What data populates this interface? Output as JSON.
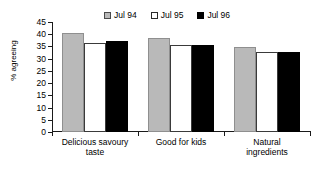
{
  "chart_data": {
    "type": "bar",
    "title": "",
    "xlabel": "",
    "ylabel": "% agreeing",
    "ylim": [
      0,
      45
    ],
    "yticks": [
      0,
      5,
      10,
      15,
      20,
      25,
      30,
      35,
      40,
      45
    ],
    "grid": false,
    "legend_position": "top-center",
    "categories": [
      "Delicious savoury taste",
      "Good for kids",
      "Natural ingredients"
    ],
    "series": [
      {
        "name": "Jul 94",
        "color": "#b9b9b9",
        "values": [
          40.5,
          38.5,
          34.8
        ]
      },
      {
        "name": "Jul 95",
        "color": "#ffffff",
        "values": [
          36.5,
          35.5,
          32.8
        ]
      },
      {
        "name": "Jul 96",
        "color": "#000000",
        "values": [
          37.4,
          35.5,
          32.7
        ]
      }
    ]
  },
  "legend": {
    "items": [
      {
        "label": "Jul 94",
        "swatch": "gray"
      },
      {
        "label": "Jul 95",
        "swatch": "white"
      },
      {
        "label": "Jul 96",
        "swatch": "black"
      }
    ]
  },
  "axes": {
    "y_title": "% agreeing",
    "y_tick_labels": [
      "45",
      "40",
      "35",
      "30",
      "25",
      "20",
      "15",
      "10",
      "5",
      "0"
    ],
    "x_tick_labels": [
      {
        "line1": "Delicious savoury",
        "line2": "taste"
      },
      {
        "line1": "Good for kids",
        "line2": ""
      },
      {
        "line1": "Natural",
        "line2": "ingredients"
      }
    ]
  }
}
